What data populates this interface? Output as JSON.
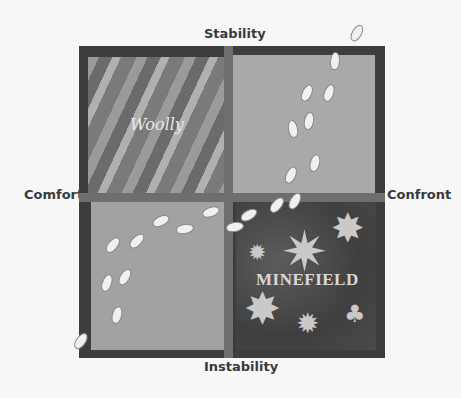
{
  "diagram": {
    "type": "quadrant",
    "axes": {
      "top": "Stability",
      "bottom": "Instability",
      "left": "Comfort",
      "right": "Confront"
    },
    "quadrants": {
      "top_left": {
        "label": "Woolly"
      },
      "top_right": {
        "label": ""
      },
      "bottom_left": {
        "label": ""
      },
      "bottom_right": {
        "label": "MINEFIELD"
      }
    },
    "decorations": {
      "footprints": "footprint-trail",
      "mines": "starburst-explosions",
      "mushroom_cloud": "mushroom-cloud"
    },
    "colors": {
      "frame": "#3d3d3d",
      "divider": "#6e6e6e",
      "background": "#f7f7f7"
    }
  }
}
